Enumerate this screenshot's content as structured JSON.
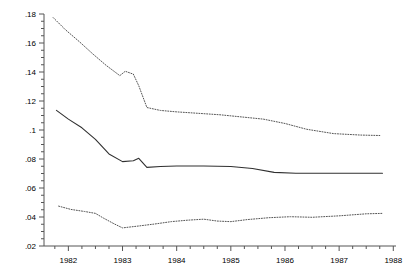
{
  "chart_data": {
    "type": "line",
    "title": "",
    "subtitle": "",
    "xlabel": "",
    "ylabel": "",
    "grid": false,
    "legend_position": "none",
    "xlim": [
      1981.55,
      1988.05
    ],
    "ylim": [
      0.02,
      0.18
    ],
    "yticks": [
      0.02,
      0.04,
      0.06,
      0.08,
      0.1,
      0.12,
      0.14,
      0.16,
      0.18
    ],
    "ytick_labels": [
      ".02",
      ".04",
      ".06",
      ".08",
      ".1",
      ".12",
      ".14",
      ".16",
      ".18"
    ],
    "yminor_step": 0.005,
    "xticks": [
      1982,
      1983,
      1984,
      1985,
      1986,
      1987,
      1988
    ],
    "xtick_labels": [
      "1982",
      "1983",
      "1984",
      "1985",
      "1986",
      "1987",
      "1988"
    ],
    "xminor_step": 0.25,
    "series": [
      {
        "name": "upper-confidence-band",
        "style": "dotted",
        "color": "#555555",
        "x": [
          1981.72,
          1981.95,
          1982.2,
          1982.45,
          1982.7,
          1982.95,
          1983.05,
          1983.2,
          1983.3,
          1983.45,
          1983.7,
          1984.0,
          1984.4,
          1984.8,
          1985.2,
          1985.6,
          1986.0,
          1986.4,
          1986.9,
          1987.4,
          1987.75
        ],
        "y": [
          0.1775,
          0.169,
          0.161,
          0.1525,
          0.1445,
          0.1375,
          0.1405,
          0.1385,
          0.1305,
          0.1155,
          0.1135,
          0.1125,
          0.1115,
          0.1105,
          0.109,
          0.1075,
          0.1045,
          0.1005,
          0.0975,
          0.0965,
          0.0962
        ]
      },
      {
        "name": "point-estimate",
        "style": "solid",
        "color": "#303030",
        "x": [
          1981.78,
          1982.0,
          1982.25,
          1982.5,
          1982.75,
          1983.0,
          1983.2,
          1983.3,
          1983.45,
          1983.7,
          1984.0,
          1984.5,
          1985.0,
          1985.4,
          1985.8,
          1986.2,
          1986.8,
          1987.4,
          1987.8
        ],
        "y": [
          0.1135,
          0.1075,
          0.1015,
          0.0935,
          0.0835,
          0.0782,
          0.0788,
          0.0805,
          0.0742,
          0.0748,
          0.0752,
          0.0752,
          0.0748,
          0.0735,
          0.0708,
          0.0702,
          0.0702,
          0.0702,
          0.0702
        ]
      },
      {
        "name": "lower-confidence-band",
        "style": "dotted",
        "color": "#555555",
        "x": [
          1981.82,
          1982.05,
          1982.3,
          1982.5,
          1982.65,
          1982.85,
          1983.0,
          1983.3,
          1983.6,
          1983.9,
          1984.2,
          1984.5,
          1984.75,
          1985.0,
          1985.3,
          1985.7,
          1986.1,
          1986.5,
          1987.0,
          1987.5,
          1987.8
        ],
        "y": [
          0.0475,
          0.0452,
          0.0438,
          0.0425,
          0.0392,
          0.0352,
          0.0325,
          0.0338,
          0.0352,
          0.0368,
          0.0378,
          0.0385,
          0.0372,
          0.0368,
          0.0382,
          0.0395,
          0.0402,
          0.0398,
          0.0408,
          0.0422,
          0.0425
        ]
      }
    ]
  },
  "axes": {
    "spine_color": "#555555",
    "background": "#ffffff"
  }
}
